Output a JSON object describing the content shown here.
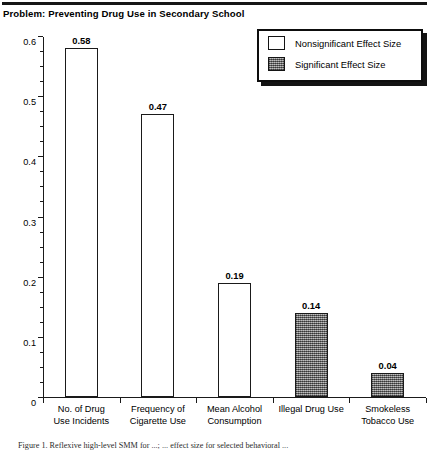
{
  "figure": {
    "title": "Problem: Preventing Drug Use in Secondary School",
    "caption": "Figure 1. Reflexive high-level SMM for ...; ... effect size for selected behavioral ..."
  },
  "legend": {
    "position": "top-right",
    "items": [
      {
        "label": "Nonsignificant Effect Size",
        "swatch": "white",
        "color": "#ffffff"
      },
      {
        "label": "Significant Effect Size",
        "swatch": "gray-stipple",
        "color": "#8b8b8b"
      }
    ]
  },
  "chart_data": {
    "type": "bar",
    "title": "Problem: Preventing Drug Use in Secondary School",
    "xlabel": "",
    "ylabel": "",
    "ylim": [
      0,
      0.6
    ],
    "grid": false,
    "y_major_ticks": [
      "0",
      "0.1",
      "0.2",
      "0.3",
      "0.4",
      "0.5",
      "0.6"
    ],
    "y_major_values": [
      0,
      0.1,
      0.2,
      0.3,
      0.4,
      0.5,
      0.6
    ],
    "y_minor_step": 0.025,
    "categories": [
      "No. of Drug\nUse Incidents",
      "Frequency of\nCigarette Use",
      "Mean Alcohol\nConsumption",
      "Illegal Drug Use",
      "Smokeless\nTobacco Use"
    ],
    "values": [
      0.58,
      0.47,
      0.19,
      0.14,
      0.04
    ],
    "value_labels": [
      "0.58",
      "0.47",
      "0.19",
      "0.14",
      "0.04"
    ],
    "significance": [
      "nonsig",
      "nonsig",
      "nonsig",
      "sig",
      "sig"
    ],
    "legend_position": "upper right"
  }
}
